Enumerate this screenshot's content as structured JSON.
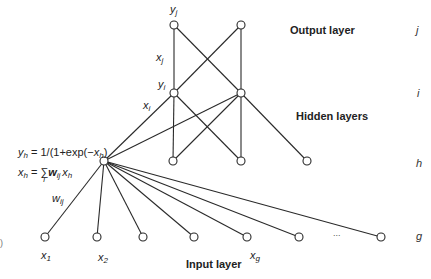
{
  "layers": {
    "output": {
      "title": "Output layer",
      "letter": "j"
    },
    "hidden_i": {
      "letter": "i"
    },
    "hidden": {
      "title": "Hidden layers"
    },
    "hidden_h": {
      "letter": "h"
    },
    "input": {
      "title": "Input layer",
      "letter": "g"
    }
  },
  "labels": {
    "yj": {
      "base": "y",
      "sub": "j"
    },
    "xj": {
      "base": "x",
      "sub": "j"
    },
    "yi": {
      "base": "y",
      "sub": "i"
    },
    "xi": {
      "base": "x",
      "sub": "i"
    },
    "wij": {
      "base": "w",
      "sub": "ij"
    },
    "x1": {
      "base": "x",
      "sub": "1"
    },
    "x2": {
      "base": "x",
      "sub": "2"
    },
    "xg": {
      "base": "x",
      "sub": "g"
    }
  },
  "formulas": {
    "activation": {
      "lhs": "y",
      "lhs_sub": "h",
      "rhs_prefix": " = 1/(1+exp(−",
      "var": "x",
      "var_sub": "h",
      "rhs_suffix": ")"
    },
    "sum": {
      "lhs": "x",
      "lhs_sub": "h",
      "eq": " = ",
      "sigma": "∑",
      "sigma_sub": "i",
      "w": "w",
      "w_sub": "ij",
      "x": "x",
      "x_sub": "h"
    }
  },
  "ellipsis": "...",
  "panel_mark": ")",
  "network": {
    "output_nodes": 2,
    "hidden_i_nodes": 2,
    "hidden_h_nodes": 4,
    "input_nodes": 7,
    "edges_output_to_i": [
      [
        0,
        0
      ],
      [
        0,
        1
      ],
      [
        1,
        0
      ],
      [
        1,
        1
      ]
    ],
    "edges_i_to_h": [
      [
        0,
        0
      ],
      [
        0,
        1
      ],
      [
        0,
        2
      ],
      [
        1,
        0
      ],
      [
        1,
        1
      ],
      [
        1,
        2
      ],
      [
        1,
        3
      ]
    ],
    "edges_h_to_input": [
      [
        0,
        0
      ],
      [
        0,
        1
      ],
      [
        0,
        2
      ],
      [
        0,
        3
      ],
      [
        0,
        4
      ],
      [
        0,
        5
      ],
      [
        0,
        6
      ]
    ]
  }
}
